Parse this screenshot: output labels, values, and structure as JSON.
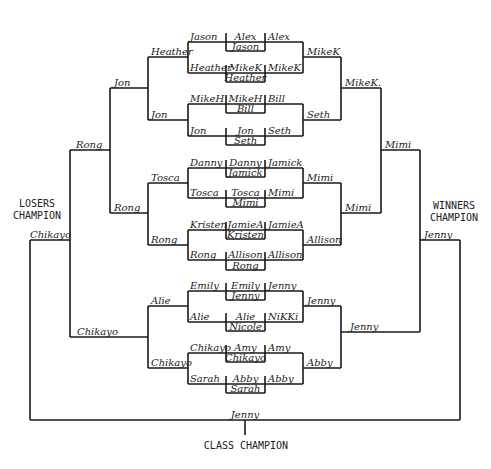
{
  "labels": {
    "losers_champion_line1": "LOSERS",
    "losers_champion_line2": "CHAMPION",
    "winners_champion_line1": "WINNERS",
    "winners_champion_line2": "CHAMPION",
    "class_champion": "CLASS CHAMPION"
  },
  "center_matches": [
    {
      "top": "Alex",
      "bottom": "Jason"
    },
    {
      "top": "MikeK",
      "bottom": "Heather"
    },
    {
      "top": "MikeH",
      "bottom": "Bill"
    },
    {
      "top": "Jon",
      "bottom": "Seth"
    },
    {
      "top": "Danny",
      "bottom": "Jamick"
    },
    {
      "top": "Tosca",
      "bottom": "Mimi"
    },
    {
      "top": "JamieA",
      "bottom": "Kristen"
    },
    {
      "top": "Allison",
      "bottom": "Rong"
    },
    {
      "top": "Emily",
      "bottom": "Jenny"
    },
    {
      "top": "Alie",
      "bottom": "Nicole"
    },
    {
      "top": "Amy",
      "bottom": "Chikayo"
    },
    {
      "top": "Abby",
      "bottom": "Sarah"
    }
  ],
  "losers": {
    "round1": [
      "Jason",
      "Heather",
      "MikeH",
      "Jon",
      "Danny",
      "Tosca",
      "Kristen",
      "Rong",
      "Emily",
      "Alie",
      "Chikayo",
      "Sarah"
    ],
    "round2": [
      "Heather",
      "Jon",
      "Tosca",
      "Rong",
      "Alie",
      "Chikayo"
    ],
    "round3": [
      "Jon",
      "Rong",
      "Chikayo"
    ],
    "round4": [
      "Rong"
    ],
    "champion": "Chikayo"
  },
  "winners": {
    "round1": [
      "Alex",
      "MikeK",
      "Bill",
      "Seth",
      "Jamick",
      "Mimi",
      "JamieA",
      "Allison",
      "Jenny",
      "NiKKi",
      "Amy",
      "Abby"
    ],
    "round2": [
      "MikeK",
      "Seth",
      "Mimi",
      "Allison",
      "Jenny",
      "Abby"
    ],
    "round3": [
      "MikeK.",
      "Mimi",
      "Jenny"
    ],
    "round4": [
      "Mimi"
    ],
    "champion": "Jenny"
  },
  "class_champion_name": "Jenny"
}
